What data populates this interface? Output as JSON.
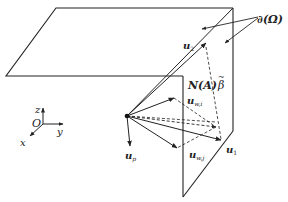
{
  "figure": {
    "type": "3d-geometry-diagram",
    "labels": {
      "boundary": "∂(Ω)",
      "u2": "u",
      "u2_sub": "2",
      "normal_cone": "N(A)",
      "beta": "β",
      "beta_tilde": "~",
      "uwi": "u",
      "uwi_sub": "w,i",
      "uwj": "u",
      "uwj_sub": "w,j",
      "u1": "u",
      "u1_sub": "1",
      "up": "u",
      "up_sub": "p"
    },
    "axes": {
      "origin": "O",
      "x": "x",
      "y": "y",
      "z": "z"
    },
    "colors": {
      "stroke": "#222222",
      "background": "#ffffff"
    }
  }
}
